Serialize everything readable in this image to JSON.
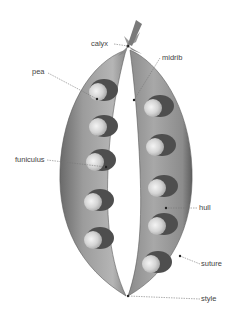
{
  "diagram": {
    "labels": [
      {
        "id": "calyx",
        "text": "calyx"
      },
      {
        "id": "midrib",
        "text": "midrib"
      },
      {
        "id": "pea",
        "text": "pea"
      },
      {
        "id": "funiculus",
        "text": "funiculus"
      },
      {
        "id": "hull",
        "text": "hull"
      },
      {
        "id": "suture",
        "text": "suture"
      },
      {
        "id": "style",
        "text": "style"
      }
    ],
    "colors": {
      "pod_dark": "#6e6e6e",
      "pod_mid": "#9a9a9a",
      "pod_light": "#c8c8c8",
      "pea": "#d8d8d8",
      "leader": "#777777",
      "text": "#444444"
    }
  }
}
